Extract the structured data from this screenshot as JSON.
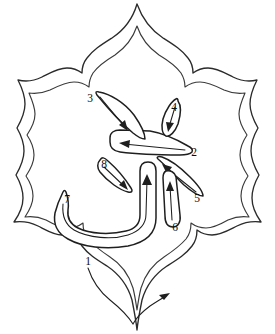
{
  "figure": {
    "type": "calligraphy-stroke-order-diagram",
    "title": "",
    "background_color": "#ffffff",
    "ink_color": "#1f1f1f",
    "frame": {
      "name": "ornamental-cartouche",
      "description": "double-outlined lobed cartouche with pointed top and bottom",
      "stroke_color": "#2b2b2b"
    },
    "stroke_count": 8,
    "strokes": [
      {
        "number": "1",
        "name": "bottom-sweep",
        "label_x": 88,
        "label_y": 262,
        "shape": "outer frame bottom V sweep",
        "direction": "left-to-right"
      },
      {
        "number": "2",
        "name": "horizontal-blade",
        "label_x": 194,
        "label_y": 153,
        "shape": "long tapered horizontal blade",
        "direction": "right-to-left"
      },
      {
        "number": "3",
        "name": "upper-diagonal-spike",
        "label_x": 90,
        "label_y": 99,
        "shape": "narrow elongated triangle",
        "direction": "up-left to down-right"
      },
      {
        "number": "4",
        "name": "small-teardrop",
        "label_x": 174,
        "label_y": 108,
        "shape": "small leaf teardrop",
        "direction": "downward"
      },
      {
        "number": "5",
        "name": "lower-right-diagonal",
        "label_x": 197,
        "label_y": 199,
        "shape": "tapered diagonal blade",
        "direction": "down-right to up-left"
      },
      {
        "number": "6",
        "name": "vertical-bar",
        "label_x": 175,
        "label_y": 228,
        "shape": "rounded vertical bar",
        "direction": "upward"
      },
      {
        "number": "7",
        "name": "hook-bowl",
        "label_x": 67,
        "label_y": 200,
        "shape": "J-shaped hook bowl",
        "direction": "left to right then upward"
      },
      {
        "number": "8",
        "name": "short-diagonal",
        "label_x": 104,
        "label_y": 165,
        "shape": "short tapered diagonal",
        "direction": "up-left to down-right"
      }
    ],
    "labels": [
      "1",
      "2",
      "3",
      "4",
      "5",
      "6",
      "7",
      "8"
    ]
  }
}
